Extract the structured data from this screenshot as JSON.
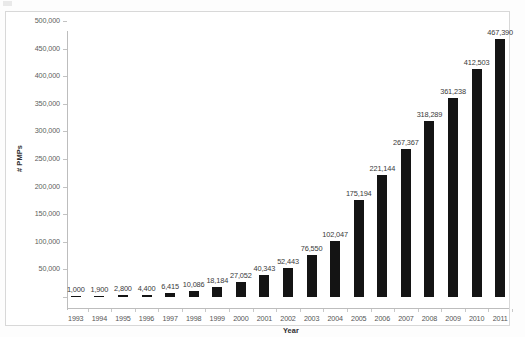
{
  "chart_data": {
    "type": "bar",
    "title": "",
    "subtitle": "",
    "xlabel": "Year",
    "ylabel": "# PMPs",
    "categories": [
      "1993",
      "1994",
      "1995",
      "1996",
      "1997",
      "1998",
      "1999",
      "2000",
      "2001",
      "2002",
      "2003",
      "2004",
      "2005",
      "2006",
      "2007",
      "2008",
      "2009",
      "2010",
      "2011"
    ],
    "values": [
      1000,
      1900,
      2800,
      4400,
      6415,
      10086,
      18184,
      27052,
      40343,
      52443,
      76550,
      102047,
      175194,
      221144,
      267367,
      318289,
      361238,
      412503,
      467390
    ],
    "value_labels": [
      "1,000",
      "1,900",
      "2,800",
      "4,400",
      "6,415",
      "10,086",
      "18,184",
      "27,052",
      "40,343",
      "52,443",
      "76,550",
      "102,047",
      "175,194",
      "221,144",
      "267,367",
      "318,289",
      "361,238",
      "412,503",
      "467,390"
    ],
    "ylim": [
      0,
      500000
    ],
    "ytick_values": [
      0,
      50000,
      100000,
      150000,
      200000,
      250000,
      300000,
      350000,
      400000,
      450000,
      500000
    ],
    "ytick_labels": [
      "",
      "50,000",
      "100,000",
      "150,000",
      "200,000",
      "250,000",
      "300,000",
      "350,000",
      "400,000",
      "450,000",
      "500,000"
    ],
    "grid": false,
    "legend": false,
    "legend_position": "none",
    "series": [
      {
        "name": "# PMPs",
        "color": "#141414",
        "values": [
          1000,
          1900,
          2800,
          4400,
          6415,
          10086,
          18184,
          27052,
          40343,
          52443,
          76550,
          102047,
          175194,
          221144,
          267367,
          318289,
          361238,
          412503,
          467390
        ]
      }
    ],
    "data_labels_shown": true,
    "annotations": []
  },
  "colors": {
    "bar": "#141414",
    "axis": "#bdbdbd",
    "frame": "#d8d8d8",
    "tick_text": "#555555",
    "label_text": "#3a3a3a",
    "background": "#ffffff"
  }
}
